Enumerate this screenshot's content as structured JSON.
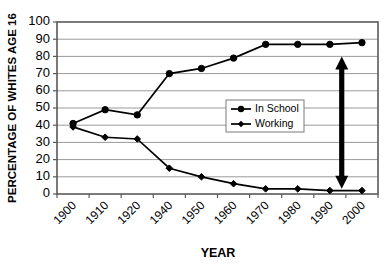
{
  "chart_data": {
    "type": "line",
    "title": "",
    "xlabel": "YEAR",
    "ylabel": "PERCENTAGE OF WHITES AGE 16",
    "categories": [
      "1900",
      "1910",
      "1920",
      "1940",
      "1950",
      "1960",
      "1970",
      "1980",
      "1990",
      "2000"
    ],
    "x": [
      1900,
      1910,
      1920,
      1940,
      1950,
      1960,
      1970,
      1980,
      1990,
      2000
    ],
    "ylim": [
      0,
      100
    ],
    "yticks": [
      0,
      10,
      20,
      30,
      40,
      50,
      60,
      70,
      80,
      90,
      100
    ],
    "xticklabels": [
      "1900",
      "1910",
      "1920",
      "1940",
      "1950",
      "1960",
      "1970",
      "1980",
      "1990",
      "2000"
    ],
    "grid": "horizontal",
    "legend_position": "center-right-inside",
    "series": [
      {
        "name": "In School",
        "marker": "circle",
        "values": [
          41,
          49,
          46,
          70,
          73,
          79,
          87,
          87,
          87,
          88
        ]
      },
      {
        "name": "Working",
        "marker": "diamond",
        "values": [
          39,
          33,
          32,
          15,
          10,
          6,
          3,
          3,
          2,
          2
        ]
      }
    ],
    "annotations": [
      {
        "name": "gap-double-arrow",
        "type": "double-headed-vertical-arrow",
        "x_year": 1993,
        "y_top": 80,
        "y_bottom": 3
      }
    ]
  },
  "legend": {
    "entries": [
      {
        "label": "In School"
      },
      {
        "label": "Working"
      }
    ]
  },
  "axes": {
    "y_title": "PERCENTAGE OF WHITES AGE 16",
    "x_title": "YEAR",
    "y_labels": [
      "100",
      "90",
      "80",
      "70",
      "60",
      "50",
      "40",
      "30",
      "20",
      "10",
      "0"
    ],
    "x_labels": [
      "1900",
      "1910",
      "1920",
      "1940",
      "1950",
      "1960",
      "1970",
      "1980",
      "1990",
      "2000"
    ]
  },
  "colors": {
    "line": "#000000",
    "grid": "#9a9a9a",
    "axis": "#595959",
    "background": "#ffffff"
  }
}
